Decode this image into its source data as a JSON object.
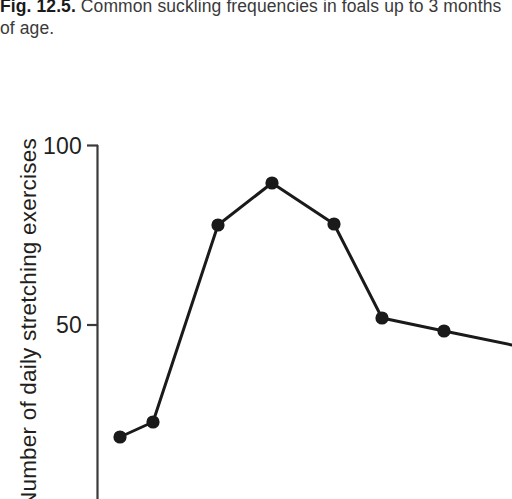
{
  "caption": {
    "figure_label": "Fig. 12.5.",
    "text": "Common suckling frequencies in foals up to 3 months of age."
  },
  "axis": {
    "y_title": "Number of daily stretching exercises",
    "y_ticks": [
      {
        "label": "100",
        "value": 100
      },
      {
        "label": "50",
        "value": 50
      }
    ]
  },
  "chart_data": {
    "type": "line",
    "title": "Common suckling frequencies in foals up to 3 months of age.",
    "xlabel": "",
    "ylabel": "Number of daily stretching exercises",
    "grid": false,
    "legend": null,
    "marker": "filled-circle",
    "marker_color": "#1a1a1a",
    "line_color": "#1a1a1a",
    "ylim": [
      0,
      100
    ],
    "y_ticks": [
      50,
      100
    ],
    "x": [
      1,
      2,
      3,
      4,
      5,
      6,
      7,
      8
    ],
    "values": [
      18.7,
      23,
      77.6,
      89.7,
      77.9,
      52.0,
      48.3,
      44.5
    ],
    "points_px": [
      {
        "x": 120,
        "y": 437
      },
      {
        "x": 153,
        "y": 422
      },
      {
        "x": 218,
        "y": 225
      },
      {
        "x": 272,
        "y": 183
      },
      {
        "x": 334,
        "y": 224
      },
      {
        "x": 382,
        "y": 318
      },
      {
        "x": 444,
        "y": 331
      },
      {
        "x": 512,
        "y": 345
      }
    ]
  }
}
